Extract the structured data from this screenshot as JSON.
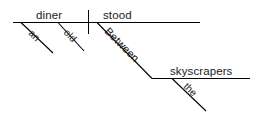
{
  "diagram": {
    "type": "sentence-diagram",
    "style": "Reed-Kellogg",
    "sentence": "An old diner stood between the skyscrapers.",
    "canvas": {
      "width": 255,
      "height": 116,
      "background": "#ffffff"
    },
    "ink_color": "#000000",
    "text_color": "#1a1a1a",
    "baseline_main": {
      "label": "main-baseline",
      "x1": 13,
      "y1": 22.5,
      "x2": 200,
      "y2": 22.5
    },
    "baseline_object": {
      "label": "object-baseline",
      "x1": 152,
      "y1": 78.5,
      "x2": 250,
      "y2": 78.5
    },
    "subject_verb_divider": {
      "label": "subject-verb-divider",
      "x": 88.5,
      "y1": 10,
      "y2": 34
    },
    "words": {
      "subject": "diner",
      "verb": "stood",
      "preposition": "Between",
      "object_of_preposition": "skyscrapers",
      "article_subject": "an",
      "adjective_subject": "old",
      "article_object": "the"
    },
    "slots": [
      {
        "name": "subject",
        "text": "diner",
        "role": "subject",
        "x": 36,
        "y": 19,
        "rotation": 0,
        "size": "normal"
      },
      {
        "name": "verb",
        "text": "stood",
        "role": "verb",
        "x": 103,
        "y": 19,
        "rotation": 0,
        "size": "normal"
      },
      {
        "name": "object-of-preposition",
        "text": "skyscrapers",
        "role": "object-of-preposition",
        "x": 170,
        "y": 75,
        "rotation": 0,
        "size": "normal"
      },
      {
        "name": "article-an",
        "text": "an",
        "role": "article-modifier",
        "x": 28,
        "y": 34,
        "rotation": 44,
        "size": "modifier"
      },
      {
        "name": "adjective-old",
        "text": "old",
        "role": "adjective-modifier",
        "x": 63,
        "y": 33,
        "rotation": 46,
        "size": "modifier"
      },
      {
        "name": "preposition-between",
        "text": "Between",
        "role": "preposition",
        "x": 104,
        "y": 32,
        "rotation": 45,
        "size": "prep"
      },
      {
        "name": "article-the",
        "text": "the",
        "role": "article-modifier",
        "x": 183,
        "y": 87,
        "rotation": 45,
        "size": "modifier"
      }
    ],
    "slant_lines": [
      {
        "name": "slant-an",
        "x1": 21,
        "y1": 22.5,
        "x2": 53,
        "y2": 53
      },
      {
        "name": "slant-old",
        "x1": 58,
        "y1": 22.5,
        "x2": 84,
        "y2": 51
      },
      {
        "name": "slant-between",
        "x1": 97,
        "y1": 22.5,
        "x2": 152,
        "y2": 78.5
      },
      {
        "name": "slant-the",
        "x1": 172,
        "y1": 78.5,
        "x2": 206,
        "y2": 111
      }
    ]
  }
}
